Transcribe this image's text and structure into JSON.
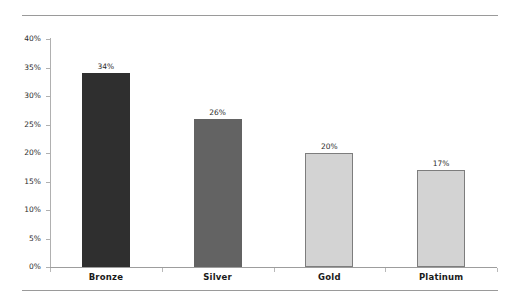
{
  "chart_data": {
    "type": "bar",
    "title": "",
    "subtitle": "",
    "xlabel": "",
    "ylabel": "",
    "categories": [
      "Bronze",
      "Silver",
      "Gold",
      "Platinum"
    ],
    "values": [
      34,
      26,
      20,
      17
    ],
    "value_labels": [
      "34%",
      "26%",
      "20%",
      "17%"
    ],
    "ylim": [
      0,
      40
    ],
    "ytick_values": [
      0,
      5,
      10,
      15,
      20,
      25,
      30,
      35,
      40
    ],
    "ytick_labels": [
      "0%",
      "5%",
      "10%",
      "15%",
      "20%",
      "25%",
      "30%",
      "35%",
      "40%"
    ],
    "grid": false,
    "legend": "none",
    "bar_colors": [
      "#2f2f2f",
      "#636363",
      "#d3d3d3",
      "#d3d3d3"
    ],
    "bar_border_colors": [
      "#2f2f2f",
      "#636363",
      "#7d7d7d",
      "#7d7d7d"
    ],
    "axis_color": "#a9a9a9",
    "text_color": "#231f20",
    "background": "#ffffff"
  },
  "decorations": {
    "top_rule": "horizontal-rule",
    "bottom_rule": "horizontal-rule"
  }
}
